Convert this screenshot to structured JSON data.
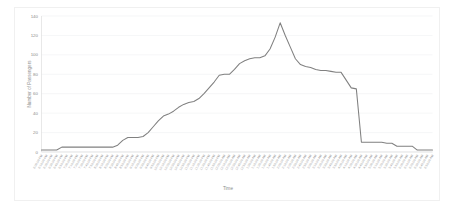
{
  "chart_data": {
    "type": "line",
    "title": "",
    "xlabel": "Time",
    "ylabel": "Number of Passengers",
    "ylim": [
      0,
      140
    ],
    "yticks": [
      0,
      20,
      40,
      60,
      80,
      100,
      120,
      140
    ],
    "grid": true,
    "legend": false,
    "legend_position": "none",
    "line_color": "#808080",
    "background_color": "#ffffff",
    "gridline_color": "#eef0f2",
    "tick_label_color": "#9a9a9a",
    "categories": [
      "6:00:00 PM",
      "6:10:00 PM",
      "6:20:00 PM",
      "6:30:00 PM",
      "6:40:00 PM",
      "6:50:00 PM",
      "7:00:00 PM",
      "7:10:00 PM",
      "7:20:00 PM",
      "7:30:00 PM",
      "7:40:00 PM",
      "7:50:00 PM",
      "8:00:00 PM",
      "8:10:00 PM",
      "8:20:00 PM",
      "8:30:00 PM",
      "8:40:00 PM",
      "8:50:00 PM",
      "9:00:00 PM",
      "9:10:00 PM",
      "9:20:00 PM",
      "9:30:00 PM",
      "9:40:00 PM",
      "9:50:00 PM",
      "10:00:00 PM",
      "10:10:00 PM",
      "10:20:00 PM",
      "10:30:00 PM",
      "10:40:00 PM",
      "10:50:00 PM",
      "11:00:00 PM",
      "11:10:00 PM",
      "11:20:00 PM",
      "11:30:00 PM",
      "11:40:00 PM",
      "11:50:00 PM",
      "12:00:00 AM",
      "12:10:00 AM",
      "12:20:00 AM",
      "12:30:00 AM",
      "12:40:00 AM",
      "12:50:00 AM",
      "1:00:00 AM",
      "1:10:00 AM",
      "1:20:00 AM",
      "1:30:00 AM",
      "1:40:00 AM",
      "1:50:00 AM",
      "2:00:00 AM",
      "2:10:00 AM",
      "2:20:00 AM",
      "2:30:00 AM",
      "2:40:00 AM",
      "2:50:00 AM",
      "3:00:00 AM",
      "3:10:00 AM",
      "3:20:00 AM",
      "3:30:00 AM",
      "3:40:00 AM",
      "3:50:00 AM",
      "4:00:00 AM",
      "4:10:00 AM",
      "4:20:00 AM",
      "4:30:00 AM",
      "4:40:00 AM",
      "4:50:00 AM",
      "5:00:00 AM",
      "5:10:00 AM",
      "5:20:00 AM",
      "5:30:00 AM",
      "5:40:00 AM",
      "5:50:00 AM",
      "6:00:00 AM",
      "6:10:00 AM",
      "6:20:00 AM",
      "6:30:00 AM",
      "6:40:00 AM",
      "6:50:00 AM"
    ],
    "series": [
      {
        "name": "Number of Passengers",
        "color": "#808080",
        "values": [
          2,
          2,
          2,
          2,
          5,
          5,
          5,
          5,
          5,
          5,
          5,
          5,
          5,
          5,
          5,
          7,
          12,
          15,
          15,
          15,
          16,
          20,
          26,
          32,
          37,
          39,
          42,
          46,
          49,
          51,
          52,
          55,
          60,
          66,
          72,
          79,
          80,
          80,
          85,
          91,
          94,
          96,
          97,
          97,
          99,
          106,
          118,
          133,
          120,
          108,
          96,
          90,
          88,
          87,
          85,
          84,
          84,
          83,
          82,
          82,
          74,
          66,
          65,
          10,
          10,
          10,
          10,
          10,
          9,
          9,
          6,
          6,
          6,
          6,
          2,
          2,
          2,
          2
        ]
      }
    ]
  }
}
